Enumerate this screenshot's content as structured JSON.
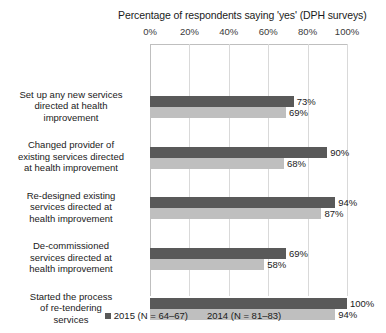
{
  "chart_data": {
    "type": "bar",
    "orientation": "horizontal",
    "title": "Percentage of respondents saying 'yes' (DPH surveys)",
    "xlabel": "",
    "ylabel": "",
    "xlim": [
      0,
      100
    ],
    "xticks": [
      "0%",
      "20%",
      "40%",
      "60%",
      "80%",
      "100%"
    ],
    "xtick_values": [
      0,
      20,
      40,
      60,
      80,
      100
    ],
    "grid": true,
    "legend_position": "bottom",
    "categories": [
      "Set up any new services directed at health improvement",
      "Changed provider of existing services directed at health improvement",
      "Re-designed existing services directed at health improvement",
      "De-commissioned services directed at health improvement",
      "Started the process of re-tendering services"
    ],
    "category_lines": [
      [
        "Set up any new services",
        "directed at health",
        "improvement"
      ],
      [
        "Changed provider of",
        "existing services directed",
        "at health improvement"
      ],
      [
        "Re-designed existing",
        "services directed at",
        "health improvement"
      ],
      [
        "De-commissioned",
        "services directed at",
        "health improvement"
      ],
      [
        "Started the process",
        "of re-tendering",
        "services"
      ]
    ],
    "series": [
      {
        "name": "2015 (N = 64–67)",
        "color": "#595959",
        "values": [
          73,
          90,
          94,
          69,
          100
        ],
        "labels": [
          "73%",
          "90%",
          "94%",
          "69%",
          "100%"
        ]
      },
      {
        "name": "2014 (N = 81–83)",
        "color": "#bfbfbf",
        "values": [
          69,
          68,
          87,
          58,
          94
        ],
        "labels": [
          "69%",
          "68%",
          "87%",
          "58%",
          "94%"
        ]
      }
    ]
  }
}
